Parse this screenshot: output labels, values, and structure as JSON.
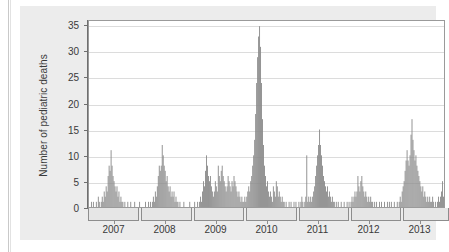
{
  "figure": {
    "panel_bg": "#ececec",
    "plot_bg": "#ffffff",
    "frame_color": "#9a9a9a"
  },
  "chart_data": {
    "type": "bar",
    "title": "",
    "xlabel": "",
    "ylabel": "Number of pediatric deaths",
    "ylim": [
      0,
      36
    ],
    "yticks": [
      0,
      5,
      10,
      15,
      20,
      25,
      30,
      35
    ],
    "ytick_labels": [
      "0",
      "5",
      "10",
      "15",
      "20",
      "25",
      "30",
      "35"
    ],
    "xtick_labels": [
      "2007",
      "2008",
      "2009",
      "2010",
      "2011",
      "2012",
      "2013"
    ],
    "xlim": [
      "2006-09",
      "2013-09"
    ],
    "grid": "horizontal",
    "legend": "none",
    "bar_color": "#8a8a8a",
    "x_unit": "week",
    "series_name": "Weekly pediatric influenza-associated deaths",
    "annotations": [
      "Season bracket boxes below x-axis mark influenza seasons",
      "Largest spike in autumn 2009 reaches 35 (H1N1 pandemic)"
    ],
    "season_brackets": [
      {
        "label": "2006-07",
        "start_week": 0,
        "end_week": 52
      },
      {
        "label": "2007-08",
        "start_week": 54,
        "end_week": 105
      },
      {
        "label": "2008-09",
        "start_week": 107,
        "end_week": 158
      },
      {
        "label": "2009-10",
        "start_week": 160,
        "end_week": 211
      },
      {
        "label": "2010-11",
        "start_week": 213,
        "end_week": 264
      },
      {
        "label": "2011-12",
        "start_week": 266,
        "end_week": 317
      },
      {
        "label": "2012-13",
        "start_week": 319,
        "end_week": 365
      }
    ],
    "peaks": [
      {
        "season": "2006-07",
        "value": 11
      },
      {
        "season": "2007-08",
        "value": 12
      },
      {
        "season": "2008-09",
        "value": 10
      },
      {
        "season": "2009-10",
        "value": 35
      },
      {
        "season": "2010-11",
        "value": 15
      },
      {
        "season": "2011-12",
        "value": 6
      },
      {
        "season": "2012-13",
        "value": 17
      }
    ],
    "values": [
      0,
      0,
      1,
      0,
      1,
      0,
      0,
      1,
      0,
      2,
      1,
      0,
      1,
      2,
      1,
      3,
      2,
      4,
      3,
      6,
      8,
      7,
      11,
      8,
      6,
      5,
      4,
      3,
      4,
      2,
      3,
      1,
      2,
      1,
      1,
      0,
      1,
      0,
      0,
      1,
      0,
      0,
      1,
      0,
      0,
      0,
      1,
      0,
      0,
      0,
      0,
      1,
      0,
      0,
      0,
      0,
      0,
      1,
      0,
      0,
      1,
      0,
      1,
      0,
      1,
      2,
      1,
      3,
      2,
      4,
      6,
      8,
      7,
      8,
      12,
      10,
      8,
      7,
      5,
      6,
      4,
      3,
      4,
      2,
      3,
      2,
      3,
      1,
      2,
      1,
      1,
      0,
      1,
      0,
      0,
      0,
      1,
      0,
      0,
      0,
      0,
      0,
      1,
      0,
      0,
      0,
      0,
      1,
      0,
      0,
      1,
      0,
      1,
      2,
      1,
      3,
      5,
      4,
      7,
      10,
      8,
      6,
      5,
      6,
      4,
      3,
      2,
      3,
      5,
      4,
      3,
      8,
      6,
      5,
      7,
      8,
      6,
      5,
      4,
      3,
      4,
      6,
      5,
      4,
      3,
      5,
      4,
      6,
      5,
      4,
      3,
      2,
      3,
      2,
      1,
      2,
      1,
      1,
      2,
      1,
      2,
      3,
      4,
      3,
      5,
      6,
      8,
      10,
      13,
      18,
      24,
      29,
      33,
      35,
      31,
      24,
      17,
      12,
      8,
      6,
      4,
      5,
      3,
      2,
      3,
      2,
      1,
      4,
      3,
      2,
      5,
      4,
      2,
      3,
      2,
      1,
      2,
      1,
      1,
      0,
      1,
      0,
      0,
      1,
      0,
      1,
      0,
      0,
      1,
      0,
      1,
      0,
      0,
      1,
      0,
      1,
      2,
      1,
      0,
      1,
      2,
      10,
      1,
      2,
      1,
      2,
      1,
      2,
      3,
      4,
      6,
      8,
      10,
      12,
      15,
      12,
      10,
      8,
      6,
      5,
      4,
      3,
      4,
      2,
      3,
      2,
      1,
      2,
      1,
      1,
      0,
      1,
      0,
      1,
      0,
      0,
      1,
      0,
      0,
      1,
      0,
      0,
      1,
      0,
      1,
      0,
      1,
      2,
      1,
      2,
      3,
      2,
      3,
      6,
      4,
      3,
      5,
      6,
      4,
      3,
      2,
      3,
      2,
      1,
      2,
      1,
      2,
      1,
      1,
      0,
      1,
      0,
      1,
      0,
      0,
      1,
      0,
      1,
      0,
      0,
      1,
      0,
      0,
      1,
      0,
      1,
      0,
      1,
      0,
      0,
      1,
      0,
      0,
      1,
      0,
      1,
      2,
      1,
      3,
      4,
      5,
      7,
      9,
      11,
      9,
      8,
      10,
      14,
      17,
      13,
      11,
      9,
      10,
      8,
      7,
      6,
      5,
      4,
      3,
      4,
      2,
      3,
      2,
      1,
      2,
      1,
      2,
      1,
      1,
      2,
      1,
      0,
      1,
      0,
      1,
      2,
      1,
      2,
      3,
      5,
      2
    ]
  }
}
